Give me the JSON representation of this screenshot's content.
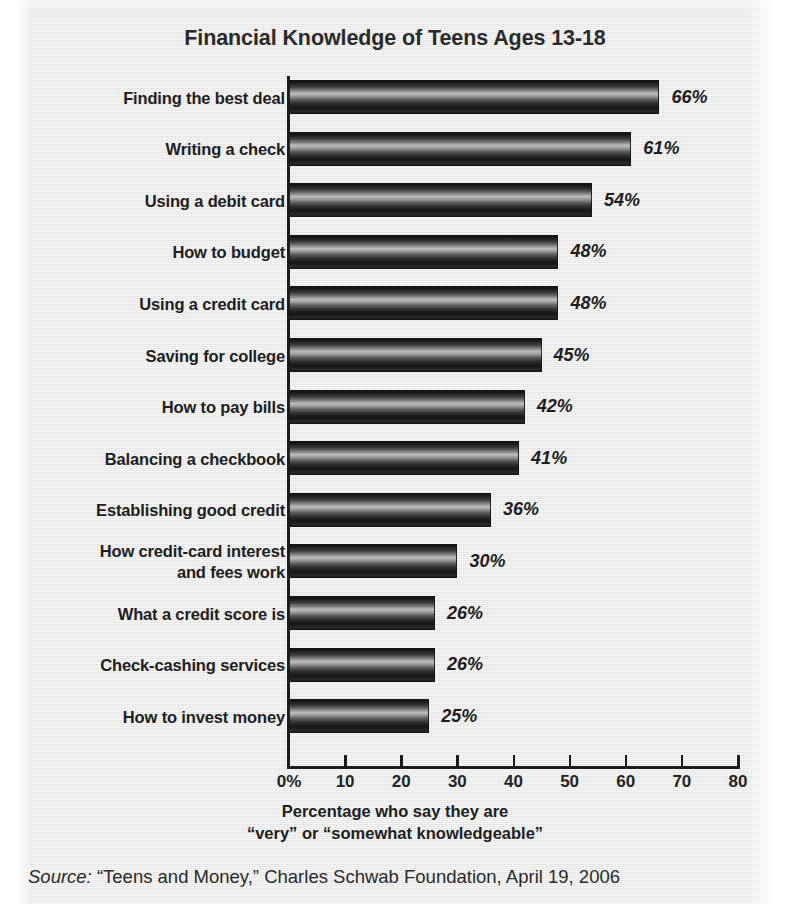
{
  "chart_data": {
    "type": "bar",
    "orientation": "horizontal",
    "title": "Financial Knowledge of Teens Ages 13-18",
    "xlabel_line1": "Percentage who say they are",
    "xlabel_line2": "“very” or “somewhat knowledgeable”",
    "ylabel": "",
    "xlim": [
      0,
      80
    ],
    "xticks": [
      0,
      10,
      20,
      30,
      40,
      50,
      60,
      70,
      80
    ],
    "xtick_labels": [
      "0%",
      "10",
      "20",
      "30",
      "40",
      "50",
      "60",
      "70",
      "80"
    ],
    "grid": false,
    "legend": null,
    "categories": [
      "Finding the best deal",
      "Writing a check",
      "Using a debit card",
      "How to budget",
      "Using a credit card",
      "Saving for college",
      "How to pay bills",
      "Balancing a checkbook",
      "Establishing good credit",
      "How credit-card interest and fees work",
      "What a credit score is",
      "Check-cashing services",
      "How to invest money"
    ],
    "values": [
      66,
      61,
      54,
      48,
      48,
      45,
      42,
      41,
      36,
      30,
      26,
      26,
      25
    ],
    "value_labels": [
      "66%",
      "61%",
      "54%",
      "48%",
      "48%",
      "45%",
      "42%",
      "41%",
      "36%",
      "30%",
      "26%",
      "26%",
      "25%"
    ],
    "bars": [
      {
        "category": "Finding the best deal",
        "category_lines": [
          "Finding the best deal"
        ],
        "value": 66,
        "label": "66%"
      },
      {
        "category": "Writing a check",
        "category_lines": [
          "Writing a check"
        ],
        "value": 61,
        "label": "61%"
      },
      {
        "category": "Using a debit card",
        "category_lines": [
          "Using a debit card"
        ],
        "value": 54,
        "label": "54%"
      },
      {
        "category": "How to budget",
        "category_lines": [
          "How to budget"
        ],
        "value": 48,
        "label": "48%"
      },
      {
        "category": "Using a credit card",
        "category_lines": [
          "Using a credit card"
        ],
        "value": 48,
        "label": "48%"
      },
      {
        "category": "Saving for college",
        "category_lines": [
          "Saving for college"
        ],
        "value": 45,
        "label": "45%"
      },
      {
        "category": "How to pay bills",
        "category_lines": [
          "How to pay bills"
        ],
        "value": 42,
        "label": "42%"
      },
      {
        "category": "Balancing a checkbook",
        "category_lines": [
          "Balancing a checkbook"
        ],
        "value": 41,
        "label": "41%"
      },
      {
        "category": "Establishing good credit",
        "category_lines": [
          "Establishing good credit"
        ],
        "value": 36,
        "label": "36%"
      },
      {
        "category": "How credit-card interest and fees work",
        "category_lines": [
          "How credit-card interest",
          "and fees work"
        ],
        "value": 30,
        "label": "30%"
      },
      {
        "category": "What a credit score is",
        "category_lines": [
          "What a credit score is"
        ],
        "value": 26,
        "label": "26%"
      },
      {
        "category": "Check-cashing services",
        "category_lines": [
          "Check-cashing services"
        ],
        "value": 26,
        "label": "26%"
      },
      {
        "category": "How to invest money",
        "category_lines": [
          "How to invest money"
        ],
        "value": 25,
        "label": "25%"
      }
    ],
    "colors": {
      "background": "#e9e9e9",
      "bar_dark": "#141414",
      "bar_highlight": "#bdbdbd",
      "axis": "#1c1c1c",
      "text": "#202020"
    }
  },
  "source": {
    "prefix": "Source:",
    "text": " “Teens and Money,” Charles Schwab Foundation, April 19, 2006"
  }
}
